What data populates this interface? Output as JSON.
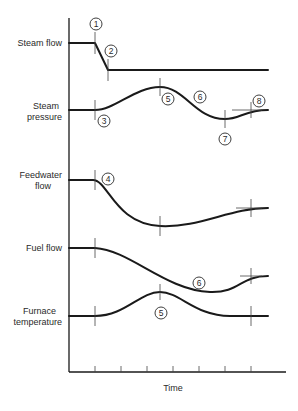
{
  "diagram": {
    "x_axis_label": "Time",
    "signals": [
      {
        "id": "steam-flow",
        "label_lines": [
          "Steam flow"
        ]
      },
      {
        "id": "steam-pressure",
        "label_lines": [
          "Steam",
          "pressure"
        ]
      },
      {
        "id": "feedwater-flow",
        "label_lines": [
          "Feedwater",
          "flow"
        ]
      },
      {
        "id": "fuel-flow",
        "label_lines": [
          "Fuel flow"
        ]
      },
      {
        "id": "furnace-temperature",
        "label_lines": [
          "Furnace",
          "temperature"
        ]
      }
    ],
    "markers": [
      {
        "n": "1",
        "signal": "steam-flow"
      },
      {
        "n": "2",
        "signal": "steam-flow"
      },
      {
        "n": "3",
        "signal": "steam-pressure"
      },
      {
        "n": "5",
        "signal": "steam-pressure"
      },
      {
        "n": "6",
        "signal": "steam-pressure"
      },
      {
        "n": "7",
        "signal": "steam-pressure"
      },
      {
        "n": "8",
        "signal": "steam-pressure"
      },
      {
        "n": "4",
        "signal": "feedwater-flow"
      },
      {
        "n": "6",
        "signal": "fuel-flow"
      },
      {
        "n": "5",
        "signal": "furnace-temperature"
      }
    ],
    "x_ticks": 7
  }
}
